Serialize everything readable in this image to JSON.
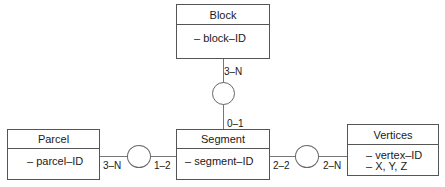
{
  "entities": {
    "block": {
      "name": "Block",
      "attributes": [
        "– block–ID"
      ]
    },
    "segment": {
      "name": "Segment",
      "attributes": [
        "– segment–ID"
      ]
    },
    "parcel": {
      "name": "Parcel",
      "attributes": [
        "– parcel–ID"
      ]
    },
    "vertices": {
      "name": "Vertices",
      "attributes": [
        "– vertex–ID",
        "– X, Y, Z"
      ]
    }
  },
  "relationships": {
    "block_segment": {
      "block_side": "3–N",
      "segment_side": "0–1"
    },
    "parcel_segment": {
      "parcel_side": "3–N",
      "segment_side": "1–2"
    },
    "segment_vertices": {
      "segment_side": "2–2",
      "vertices_side": "2–N"
    }
  }
}
